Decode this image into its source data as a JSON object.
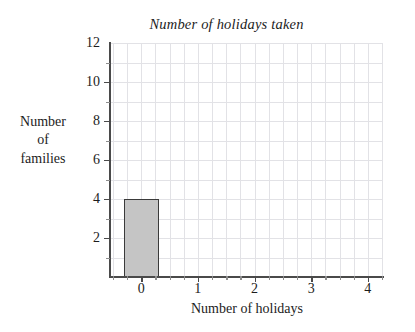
{
  "chart_data": {
    "type": "bar",
    "title": "Number of holidays taken",
    "xlabel": "Number of holidays",
    "ylabel": "Number of families",
    "ylabel_lines": [
      "Number",
      "of",
      "families"
    ],
    "categories": [
      "0",
      "1",
      "2",
      "3",
      "4"
    ],
    "x": [
      0,
      1,
      2,
      3,
      4
    ],
    "values": [
      4,
      0,
      0,
      0,
      0
    ],
    "series": [
      {
        "name": "Number of families",
        "values": [
          4,
          0,
          0,
          0,
          0
        ]
      }
    ],
    "xlim": [
      -0.55,
      4.25
    ],
    "ylim": [
      0,
      12
    ],
    "x_ticks": [
      0,
      1,
      2,
      3,
      4
    ],
    "x_tick_labels": [
      "0",
      "1",
      "2",
      "3",
      "4"
    ],
    "x_minor_tick_step": 0.25,
    "y_ticks": [
      2,
      4,
      6,
      8,
      10,
      12
    ],
    "y_tick_labels": [
      "2",
      "4",
      "6",
      "8",
      "10",
      "12"
    ],
    "y_minor_tick_step": 1,
    "grid": true,
    "grid_color": "#e2e2e6",
    "grid_x_step": 0.25,
    "grid_y_step": 1,
    "legend": null,
    "bar_width": 0.62,
    "bar_fill_color": "#c5c5c5",
    "bar_edge_color": "#3a3a3a",
    "axis_color": "#4a4a4a",
    "text_color": "#1c1c1c",
    "background_color": "#ffffff",
    "title_style": "italic"
  }
}
